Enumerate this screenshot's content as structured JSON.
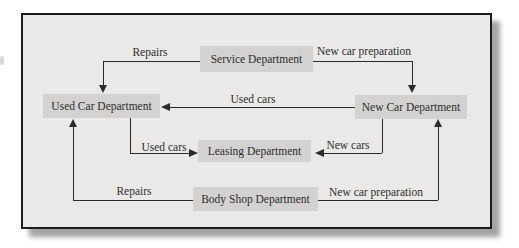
{
  "diagram": {
    "nodes": [
      {
        "id": "service",
        "label": "Service Department"
      },
      {
        "id": "used",
        "label": "Used Car Department"
      },
      {
        "id": "new",
        "label": "New Car Department"
      },
      {
        "id": "leasing",
        "label": "Leasing Department"
      },
      {
        "id": "bodyshop",
        "label": "Body Shop Department"
      }
    ],
    "edges": [
      {
        "from": "Service Department",
        "to": "Used Car Department",
        "label": "Repairs"
      },
      {
        "from": "Service Department",
        "to": "New Car Department",
        "label": "New car preparation"
      },
      {
        "from": "New Car Department",
        "to": "Used Car Department",
        "label": "Used cars"
      },
      {
        "from": "Used Car Department",
        "to": "Leasing Department",
        "label": "Used cars"
      },
      {
        "from": "New Car Department",
        "to": "Leasing Department",
        "label": "New cars"
      },
      {
        "from": "Body Shop Department",
        "to": "Used Car Department",
        "label": "Repairs"
      },
      {
        "from": "Body Shop Department",
        "to": "New Car Department",
        "label": "New car preparation"
      }
    ],
    "colors": {
      "page_bg": "#ffffff",
      "canvas_bg": "#eae9e7",
      "frame_border": "#1b1b1b",
      "node_bg": "#d3d2d0",
      "line": "#2b2b2b",
      "text": "#2d2d2d",
      "shadow": "#a3a3a3"
    }
  }
}
